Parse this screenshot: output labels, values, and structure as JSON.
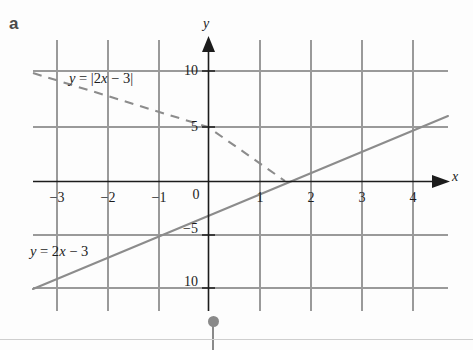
{
  "figure": {
    "panel_label": "a",
    "axis_names": {
      "x": "x",
      "y": "y"
    },
    "curve_labels": {
      "absolute_value": "y = |2x − 3|",
      "linear": "y = 2x − 3"
    },
    "colors": {
      "gridline": "#9a9a9a",
      "axis": "#1c1c1c",
      "curve": "#8c8c8c",
      "panel_label": "#4a4a4a",
      "background": "#fdfdfd",
      "pin": "#8a8a8a"
    }
  },
  "chart_data": {
    "type": "line",
    "title": "",
    "xlabel": "x",
    "ylabel": "y",
    "xlim": [
      -3.5,
      4.4
    ],
    "ylim": [
      -11,
      11
    ],
    "xticks": [
      -3,
      -2,
      -1,
      0,
      1,
      2,
      3,
      4
    ],
    "xtick_labels": [
      "−3",
      "−2",
      "−1",
      "0",
      "1",
      "2",
      "3",
      "4"
    ],
    "yticks": [
      -10,
      -5,
      5,
      10
    ],
    "ytick_labels": [
      "10",
      "−5",
      "5",
      "10"
    ],
    "grid": true,
    "legend": "inline-annotations",
    "series": [
      {
        "name": "y = 2x − 3",
        "style": "solid",
        "color": "#8c8c8c",
        "x": [
          -3.45,
          4.4
        ],
        "y": [
          -9.9,
          5.8
        ],
        "equation": "y = 2x - 3",
        "slope": 2,
        "intercept": -3,
        "x_intercept": 1.5,
        "points": [
          {
            "x": -3.45,
            "y": -9.9
          },
          {
            "x": -1,
            "y": -5
          },
          {
            "x": 0,
            "y": -3
          },
          {
            "x": 1.5,
            "y": 0
          },
          {
            "x": 4,
            "y": 5
          },
          {
            "x": 4.4,
            "y": 5.8
          }
        ]
      },
      {
        "name": "y = |2x − 3|",
        "style": "dashed",
        "color": "#8c8c8c",
        "equation": "y = |2x - 3|",
        "vertex": {
          "x": 1.5,
          "y": 0
        },
        "points": [
          {
            "x": -3.45,
            "y": 9.9
          },
          {
            "x": -1,
            "y": 5
          },
          {
            "x": 0,
            "y": 3
          },
          {
            "x": 1.5,
            "y": 0
          }
        ]
      }
    ]
  },
  "tick_labels": {
    "x": [
      {
        "id": "x-neg3",
        "text": "−3"
      },
      {
        "id": "x-neg2",
        "text": "−2"
      },
      {
        "id": "x-neg1",
        "text": "−1"
      },
      {
        "id": "x-1",
        "text": "1"
      },
      {
        "id": "x-2",
        "text": "2"
      },
      {
        "id": "x-3",
        "text": "3"
      },
      {
        "id": "x-4",
        "text": "4"
      }
    ],
    "origin": "0",
    "y": [
      {
        "id": "y-10",
        "text": "10"
      },
      {
        "id": "y-5",
        "text": "5"
      },
      {
        "id": "y-neg5",
        "text": "−5"
      },
      {
        "id": "y-neg10",
        "text": "10"
      }
    ]
  }
}
